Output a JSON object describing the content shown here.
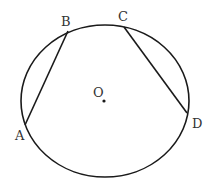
{
  "diagram": {
    "type": "circle-with-chords",
    "stroke_color": "#1a1a1a",
    "label_color": "#333333",
    "circle": {
      "cx": 105,
      "cy": 101,
      "rx": 84,
      "ry": 76,
      "center_label": "O"
    },
    "points": [
      {
        "name": "A",
        "x": 25,
        "y": 125,
        "label_x": 15,
        "label_y": 140
      },
      {
        "name": "B",
        "x": 68,
        "y": 31,
        "label_x": 61,
        "label_y": 26
      },
      {
        "name": "C",
        "x": 124,
        "y": 27,
        "label_x": 118,
        "label_y": 21
      },
      {
        "name": "D",
        "x": 187,
        "y": 113,
        "label_x": 192,
        "label_y": 128
      }
    ],
    "chords": [
      {
        "from": "A",
        "to": "B"
      },
      {
        "from": "C",
        "to": "D"
      }
    ],
    "center": {
      "label": "O",
      "x": 104,
      "y": 101,
      "label_x": 93,
      "label_y": 97
    }
  }
}
